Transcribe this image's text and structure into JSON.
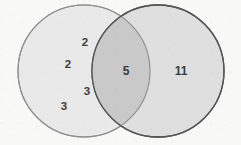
{
  "diagram": {
    "type": "venn-two-set",
    "background_color": "#f8f8f6",
    "left_circle": {
      "fill": "#e9e9e9",
      "stroke": "#8d8d8d",
      "cx": 84,
      "cy": 71,
      "r": 66
    },
    "right_circle": {
      "fill": "#dddddd",
      "stroke": "#555555",
      "cx": 158,
      "cy": 71,
      "r": 66
    },
    "intersection": {
      "fill": "#c9c9c9"
    },
    "labels": [
      {
        "id": "left-2-upper",
        "text": "2",
        "region": "left-only",
        "x": 85,
        "y": 43,
        "size": "mid"
      },
      {
        "id": "left-2-lower",
        "text": "2",
        "region": "left-only",
        "x": 68,
        "y": 65,
        "size": "mid"
      },
      {
        "id": "left-3-upper",
        "text": "3",
        "region": "left-only",
        "x": 87,
        "y": 92,
        "size": "mid"
      },
      {
        "id": "left-3-lower",
        "text": "3",
        "region": "left-only",
        "x": 64,
        "y": 107,
        "size": "mid"
      },
      {
        "id": "intersection-5",
        "text": "5",
        "region": "intersection",
        "x": 126,
        "y": 71,
        "size": "big"
      },
      {
        "id": "right-11",
        "text": "11",
        "region": "right-only",
        "x": 181,
        "y": 71,
        "size": "big"
      }
    ]
  }
}
